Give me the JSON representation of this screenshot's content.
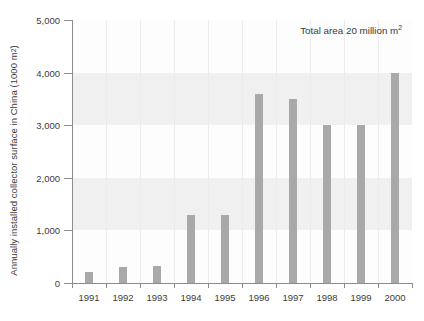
{
  "chart_data": {
    "type": "bar",
    "title": "",
    "xlabel": "",
    "ylabel": "Annually installed collector surface in China (1000 m²)",
    "ylabel_main": "Annually installed collector surface in China (1000 m",
    "ylabel_sup": "2",
    "ylabel_tail": ")",
    "categories": [
      "1991",
      "1992",
      "1993",
      "1994",
      "1995",
      "1996",
      "1997",
      "1998",
      "1999",
      "2000"
    ],
    "values": [
      200,
      300,
      320,
      1300,
      1300,
      3600,
      3500,
      3000,
      3000,
      4000
    ],
    "ylim": [
      0,
      5000
    ],
    "xlim_note": "categorical years 1991-2000",
    "ytick_values": [
      0,
      1000,
      2000,
      3000,
      4000,
      5000
    ],
    "ytick_labels": [
      "0",
      "1,000",
      "2,000",
      "3,000",
      "4,000",
      "5,000"
    ],
    "grid": "horizontal alternating bands plus vertical category separators",
    "legend": "none",
    "annotations": [
      {
        "text": "Total area 20 million m²",
        "text_main": "Total area 20 million m",
        "text_sup": "2",
        "position": "top-right"
      }
    ],
    "bands": [
      {
        "from": 1000,
        "to": 2000
      },
      {
        "from": 3000,
        "to": 4000
      }
    ],
    "colors": {
      "bar": "#a9a9a9",
      "axis": "#8c8c8c",
      "text": "#3b3b3b",
      "band": "#f0f0f0",
      "vgrid": "#ececec",
      "background": "#ffffff"
    }
  }
}
